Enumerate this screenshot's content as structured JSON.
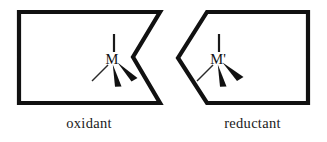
{
  "figure": {
    "name": "oxidant-reductant-metal-complex-diagram",
    "background_color": "#ffffff",
    "stroke_color": "#111111",
    "width": 327,
    "height": 142,
    "left_group": {
      "caption": "oxidant",
      "atom_label": "M",
      "shape": "rectangle-with-right-v-notch",
      "shape_points": "19,12 160,12 133,57 160,103 19,103",
      "bonds": [
        {
          "name": "bond-up-plain",
          "type": "plain",
          "direction": "up"
        },
        {
          "name": "bond-down-left-thin",
          "type": "thin",
          "direction": "down-left"
        },
        {
          "name": "bond-down-wedge",
          "type": "wedge",
          "direction": "down"
        },
        {
          "name": "bond-down-right-wedge",
          "type": "wedge",
          "direction": "down-right"
        }
      ]
    },
    "right_group": {
      "caption": "reductant",
      "atom_label": "M'",
      "shape": "rectangle-with-left-point",
      "shape_points": "207,12 308,12 308,103 207,103 178,58",
      "bonds": [
        {
          "name": "bond-up-plain",
          "type": "plain",
          "direction": "up"
        },
        {
          "name": "bond-down-left-thin",
          "type": "thin",
          "direction": "down-left"
        },
        {
          "name": "bond-down-wedge",
          "type": "wedge",
          "direction": "down"
        },
        {
          "name": "bond-down-right-wedge",
          "type": "wedge",
          "direction": "down-right"
        }
      ]
    }
  }
}
